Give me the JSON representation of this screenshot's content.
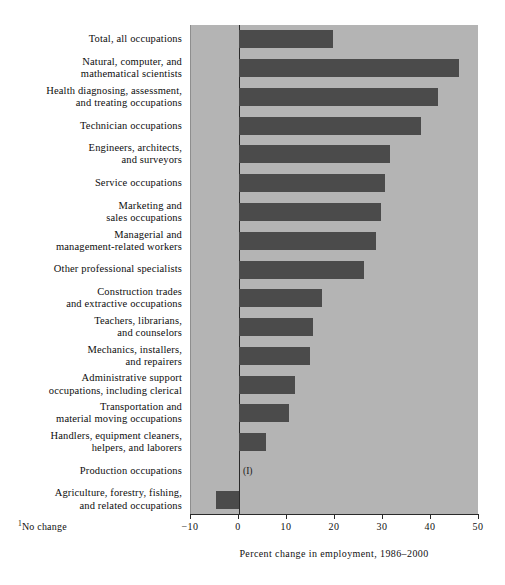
{
  "chart_data": {
    "type": "bar",
    "orientation": "horizontal",
    "title": "",
    "xlabel": "Percent change in employment, 1986–2000",
    "ylabel": "",
    "xlim": [
      -10,
      50
    ],
    "xticks": [
      -10,
      0,
      10,
      20,
      30,
      40,
      50
    ],
    "xtick_labels": [
      "−10",
      "0",
      "10",
      "20",
      "30",
      "40",
      "50"
    ],
    "grid": false,
    "legend": null,
    "bar_color": "#4b4b4b",
    "plot_background": "#b4b4b4",
    "categories": [
      "Total, all occupations",
      "Natural, computer, and\nmathematical scientists",
      "Health diagnosing, assessment,\nand treating occupations",
      "Technician occupations",
      "Engineers, architects,\nand surveyors",
      "Service occupations",
      "Marketing and\nsales occupations",
      "Managerial and\nmanagement-related workers",
      "Other professional specialists",
      "Construction trades\nand extractive occupations",
      "Teachers, librarians,\nand counselors",
      "Mechanics, installers,\nand repairers",
      "Administrative support\noccupations, including clerical",
      "Transportation and\nmaterial moving occupations",
      "Handlers, equipment cleaners,\nhelpers, and laborers",
      "Production occupations",
      "Agriculture, forestry, fishing,\nand related occupations"
    ],
    "values": [
      19.5,
      45.8,
      41.5,
      38.0,
      31.5,
      30.5,
      29.5,
      28.5,
      26.0,
      17.3,
      15.5,
      14.8,
      11.7,
      10.5,
      5.7,
      0,
      -4.8
    ],
    "annotations": [
      {
        "category": "Production occupations",
        "text": "(I)",
        "meaning": "No change"
      }
    ],
    "footnote": "No change",
    "footnote_marker": "1"
  }
}
